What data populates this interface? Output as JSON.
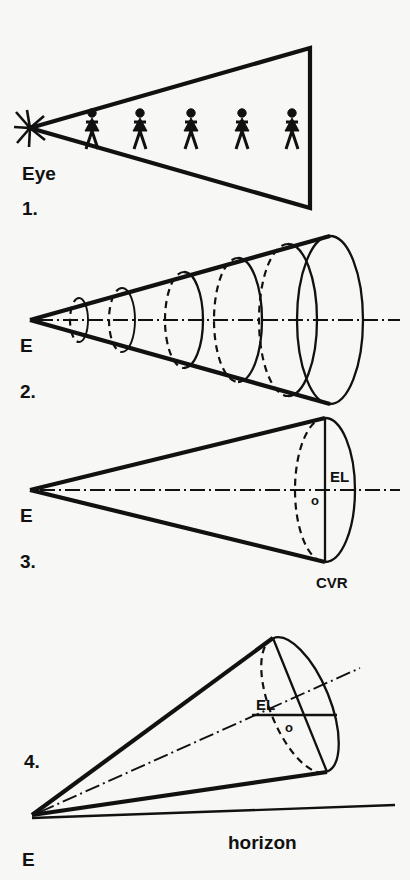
{
  "figure": {
    "background_color": "#f7f7f5",
    "ink_color": "#111111"
  },
  "panels": [
    {
      "number_label": "1.",
      "eye_label": "Eye",
      "caption_items": [
        "Eye"
      ],
      "description": "Flat triangular cone of vision from eye point with five equal-height human figures",
      "figures_count": 5,
      "apex": {
        "x": 30,
        "y": 128
      },
      "picture_plane": {
        "x": 310,
        "y_top": 48,
        "y_bottom": 208
      }
    },
    {
      "number_label": "2.",
      "eye_label": "E",
      "description": "Cone of vision with five nested elliptical cross-sections of increasing size",
      "sections_count": 5,
      "apex": {
        "x": 30,
        "y": 320
      },
      "base_center": {
        "x": 330,
        "y": 320
      }
    },
    {
      "number_label": "3.",
      "eye_label": "E",
      "eye_level_label": "EL",
      "center_label": "o",
      "base_label": "CVR",
      "description": "Cone of vision with single base circle, central axis, eye level line and center of vision",
      "apex": {
        "x": 30,
        "y": 490
      },
      "base_center": {
        "x": 325,
        "y": 490
      }
    },
    {
      "number_label": "4.",
      "eye_label": "E",
      "eye_level_label": "EL",
      "center_label": "o",
      "ground_label": "horizon",
      "description": "Tilted cone of vision inclined upward from eye, base circle rotated, horizon line at eye level",
      "apex": {
        "x": 32,
        "y": 815
      },
      "base_center": {
        "x": 300,
        "y": 705
      }
    }
  ],
  "legend_terms": {
    "EL": "eye level",
    "CVR": "cone of vision radius",
    "o": "center of vision",
    "E": "eye",
    "horizon": "horizon"
  }
}
